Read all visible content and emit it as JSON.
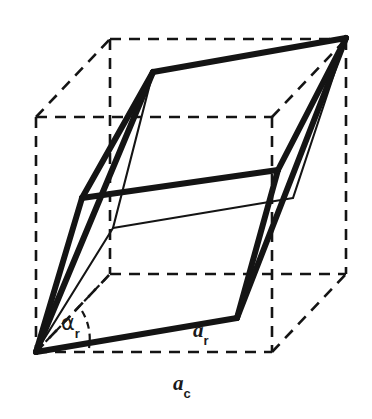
{
  "figure": {
    "name": "rhombohedral-unit-cell-in-cube",
    "background_color": "#ffffff",
    "line_color": "#111111",
    "labels": {
      "alpha_r": {
        "base": "α",
        "subscript": "r",
        "full": "αr"
      },
      "a_r": {
        "base": "a",
        "subscript": "r",
        "full": "ar"
      },
      "a_c": {
        "base": "a",
        "subscript": "c",
        "full": "ac"
      }
    },
    "geometry": {
      "cube": {
        "style": "dashed",
        "stroke_width": 2.6,
        "dash_pattern": "11 8",
        "front_face": [
          [
            36,
            117
          ],
          [
            272,
            117
          ],
          [
            272,
            352
          ],
          [
            36,
            352
          ]
        ],
        "back_face": [
          [
            110,
            39
          ],
          [
            346,
            39
          ],
          [
            346,
            274
          ],
          [
            110,
            274
          ]
        ],
        "depth_offset": [
          74,
          -78
        ]
      },
      "rhombohedron": {
        "style": "solid",
        "stroke_width_thick": 6.0,
        "stroke_width_thin": 2.0,
        "origin_vertex": [
          36,
          352
        ],
        "visible_vertices": [
          [
            36,
            352
          ],
          [
            237,
            318
          ],
          [
            346,
            38
          ],
          [
            153,
            72
          ],
          [
            82,
            198
          ],
          [
            278,
            170
          ]
        ],
        "hidden_vertices": [
          [
            113,
            228
          ],
          [
            293,
            198
          ]
        ]
      },
      "angle_arc": {
        "style": "dashed",
        "center": [
          36,
          352
        ],
        "radius": 54,
        "start_deg": 212,
        "end_deg": 280
      }
    }
  }
}
